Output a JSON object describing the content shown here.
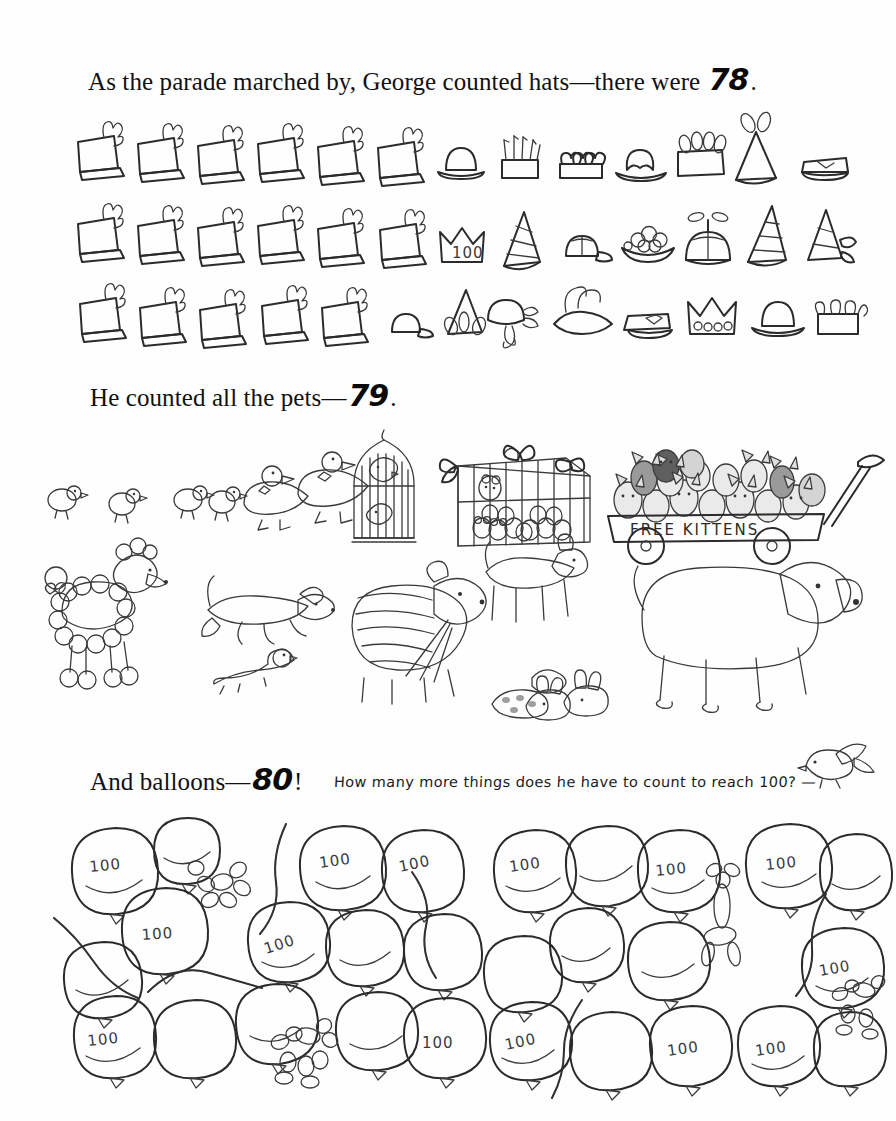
{
  "page": {
    "background_color": "#fefefe",
    "ink_color": "#2b2b2b"
  },
  "captions": {
    "hats": {
      "text_before": "As the parade marched by, George counted hats—there were ",
      "number": "78",
      "text_after": "."
    },
    "pets": {
      "text_before": "He counted all the pets—",
      "number": "79",
      "text_after": "."
    },
    "balloons": {
      "text_before": "And balloons—",
      "number": "80",
      "text_after": "!"
    },
    "question": "How many more things does he have to count to reach 100?  —"
  },
  "hats_section": {
    "label": "hats",
    "total": 78,
    "rows": [
      {
        "row": 1,
        "items": [
          {
            "type": "shako",
            "name": "band-shako-hat",
            "shade": "#6e6e6e"
          },
          {
            "type": "shako",
            "name": "band-shako-hat",
            "shade": "#6e6e6e"
          },
          {
            "type": "shako",
            "name": "band-shako-hat",
            "shade": "#6e6e6e"
          },
          {
            "type": "shako",
            "name": "band-shako-hat",
            "shade": "#6e6e6e"
          },
          {
            "type": "shako",
            "name": "band-shako-hat",
            "shade": "#6e6e6e"
          },
          {
            "type": "shako",
            "name": "band-shako-hat",
            "shade": "#6e6e6e"
          },
          {
            "type": "bowler",
            "name": "bowler-hat",
            "shade": "#a8a8a8"
          },
          {
            "type": "fringe-crown",
            "name": "fringed-crown-hat",
            "shade": "#b4b4b4"
          },
          {
            "type": "heart-crown",
            "name": "heart-crown-hat",
            "shade": "#9a9a9a"
          },
          {
            "type": "fedora",
            "name": "fedora-hat",
            "shade": "#a5a5a5"
          },
          {
            "type": "feather-box",
            "name": "feathered-box-hat",
            "shade": "#b0b0b0"
          },
          {
            "type": "cone-plume",
            "name": "plumed-party-cone-hat",
            "shade": "#9e9e9e"
          },
          {
            "type": "peaked-cap",
            "name": "peaked-cap-hat",
            "shade": "#8e8e8e"
          }
        ]
      },
      {
        "row": 2,
        "items": [
          {
            "type": "shako",
            "name": "band-shako-hat",
            "shade": "#6e6e6e"
          },
          {
            "type": "shako",
            "name": "band-shako-hat",
            "shade": "#6e6e6e"
          },
          {
            "type": "shako",
            "name": "band-shako-hat",
            "shade": "#6e6e6e"
          },
          {
            "type": "shako",
            "name": "band-shako-hat",
            "shade": "#6e6e6e"
          },
          {
            "type": "shako",
            "name": "band-shako-hat",
            "shade": "#6e6e6e"
          },
          {
            "type": "shako",
            "name": "band-shako-hat",
            "shade": "#6e6e6e"
          },
          {
            "type": "crown-100",
            "name": "crown-hat-with-100",
            "shade": "#cfcfcf",
            "label": "100"
          },
          {
            "type": "striped-cone",
            "name": "striped-cone-hat",
            "shade": "#9d9d9d"
          },
          {
            "type": "baseball-cap",
            "name": "baseball-cap-hat",
            "shade": "#c6c6c6"
          },
          {
            "type": "fruit-hat",
            "name": "fruit-bowl-hat",
            "shade": "#8c8c8c"
          },
          {
            "type": "propeller-beanie",
            "name": "propeller-beanie-hat",
            "shade": "#8a8a8a"
          },
          {
            "type": "ring-cone",
            "name": "ringed-party-cone-hat",
            "shade": "#a0a0a0"
          },
          {
            "type": "ribbon-cone",
            "name": "ribboned-cone-hat",
            "shade": "#aaaaaa"
          }
        ]
      },
      {
        "row": 3,
        "items": [
          {
            "type": "shako",
            "name": "band-shako-hat",
            "shade": "#6e6e6e"
          },
          {
            "type": "shako",
            "name": "band-shako-hat",
            "shade": "#6e6e6e"
          },
          {
            "type": "shako",
            "name": "band-shako-hat",
            "shade": "#6e6e6e"
          },
          {
            "type": "shako",
            "name": "band-shako-hat",
            "shade": "#6e6e6e"
          },
          {
            "type": "shako",
            "name": "band-shako-hat",
            "shade": "#6e6e6e"
          },
          {
            "type": "light-cap",
            "name": "light-cap-hat",
            "shade": "#cacaca"
          },
          {
            "type": "ear-cone",
            "name": "eared-cone-hat",
            "shade": "#8d8d8d"
          },
          {
            "type": "bonnet",
            "name": "ribbon-bonnet-hat",
            "shade": "#dcdcdc"
          },
          {
            "type": "tricorn",
            "name": "plumed-tricorn-hat",
            "shade": "#9b9b9b"
          },
          {
            "type": "police-cap",
            "name": "police-cap-hat",
            "shade": "#8b8b8b"
          },
          {
            "type": "jewel-crown",
            "name": "jeweled-crown-hat",
            "shade": "#bdbdbd"
          },
          {
            "type": "derby",
            "name": "derby-hat",
            "shade": "#a2a2a2"
          },
          {
            "type": "jester",
            "name": "jester-hat",
            "shade": "#aeaeae"
          }
        ]
      }
    ]
  },
  "pets_section": {
    "label": "pets",
    "total": 79,
    "groups": [
      {
        "name": "ducklings",
        "count": 4,
        "description": "four ducklings walking"
      },
      {
        "name": "adult-ducks",
        "count": 2,
        "description": "two ducks with bow ties"
      },
      {
        "name": "birdcage-birds",
        "count": 2,
        "description": "two birds in a hanging birdcage"
      },
      {
        "name": "caged-mice",
        "count": 12,
        "description": "mice in a ribbon-tied cage"
      },
      {
        "name": "wagon-kittens",
        "count": 18,
        "description": "kittens in a red wagon"
      },
      {
        "name": "poodle",
        "count": 1,
        "description": "groomed poodle with bow"
      },
      {
        "name": "running-dog",
        "count": 1,
        "description": "dog leaping"
      },
      {
        "name": "ferret",
        "count": 1,
        "description": "ferret on the ground"
      },
      {
        "name": "shaggy-dog",
        "count": 1,
        "description": "shaggy dog holding leashes"
      },
      {
        "name": "leashed-small-pets",
        "count": 5,
        "description": "rabbits and guinea pigs on leashes"
      },
      {
        "name": "medium-dog",
        "count": 1,
        "description": "spotted dog standing"
      },
      {
        "name": "big-hound",
        "count": 1,
        "description": "large hound dog"
      },
      {
        "name": "perched-bird",
        "count": 1,
        "description": "small bird near the question"
      }
    ],
    "wagon_sign": "FREE KITTENS"
  },
  "balloons_section": {
    "label": "balloons",
    "total": 80,
    "balloon_label": "100",
    "clusters": [
      {
        "name": "left-balloon-cluster",
        "balloons": [
          {
            "shade": "#d2d2d2",
            "label": "100"
          },
          {
            "shade": "#9b9b9b",
            "label": ""
          },
          {
            "shade": "#6b6b6b",
            "label": "100"
          },
          {
            "shade": "#c9c9c9",
            "label": "100"
          },
          {
            "shade": "#8f8f8f",
            "label": "100"
          },
          {
            "shade": "#a7a7a7",
            "label": "100"
          },
          {
            "shade": "#d8d8d8",
            "label": ""
          },
          {
            "shade": "#8a8a8a",
            "label": ""
          },
          {
            "shade": "#b5b5b5",
            "label": ""
          },
          {
            "shade": "#cfcfcf",
            "label": "100"
          },
          {
            "shade": "#7e7e7e",
            "label": ""
          },
          {
            "shade": "#e0e0e0",
            "label": ""
          },
          {
            "shade": "#a0a0a0",
            "label": ""
          },
          {
            "shade": "#bdbdbd",
            "label": "100"
          }
        ],
        "twists": [
          {
            "name": "balloon-animal-dog"
          },
          {
            "name": "balloon-animal-dog"
          }
        ],
        "noodles": 4
      },
      {
        "name": "right-balloon-cluster",
        "balloons": [
          {
            "shade": "#bdbdbd",
            "label": "100"
          },
          {
            "shade": "#8e8e8e",
            "label": ""
          },
          {
            "shade": "#e2e2e2",
            "label": "100"
          },
          {
            "shade": "#7d7d7d",
            "label": "100"
          },
          {
            "shade": "#ececec",
            "label": ""
          },
          {
            "shade": "#d6d6d6",
            "label": ""
          },
          {
            "shade": "#9a9a9a",
            "label": ""
          },
          {
            "shade": "#8c8c8c",
            "label": "100"
          },
          {
            "shade": "#a6a6a6",
            "label": ""
          },
          {
            "shade": "#b9b9b9",
            "label": ""
          },
          {
            "shade": "#7a7a7a",
            "label": "100"
          },
          {
            "shade": "#cdcdcd",
            "label": "100"
          },
          {
            "shade": "#a3a3a3",
            "label": ""
          },
          {
            "shade": "#dadada",
            "label": ""
          }
        ],
        "twists": [
          {
            "name": "balloon-animal-giraffe"
          },
          {
            "name": "balloon-animal-dog"
          }
        ],
        "noodles": 2
      }
    ]
  }
}
